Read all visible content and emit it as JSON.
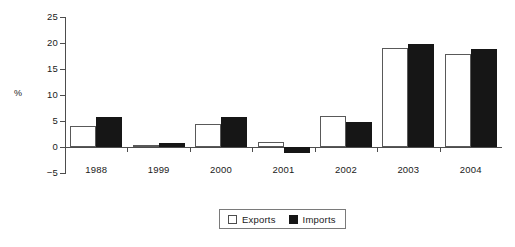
{
  "chart_data": {
    "type": "bar",
    "title": "",
    "subtitle": "",
    "xlabel": "",
    "ylabel": "%",
    "categories": [
      "1988",
      "1999",
      "2000",
      "2001",
      "2002",
      "2003",
      "2004"
    ],
    "series": [
      {
        "name": "Exports",
        "values": [
          4.0,
          0.4,
          4.4,
          1.0,
          6.0,
          19.0,
          17.8
        ],
        "color": "#ffffff",
        "edge_color": "#595959"
      },
      {
        "name": "Imports",
        "values": [
          5.8,
          0.7,
          5.8,
          -1.1,
          4.8,
          19.9,
          18.8
        ],
        "color": "#161616",
        "edge_color": "#161616"
      }
    ],
    "ylim": [
      -5,
      25
    ],
    "yticks": [
      25,
      20,
      15,
      10,
      5,
      0,
      -5
    ],
    "ytick_labels": [
      "25",
      "20",
      "15",
      "10",
      "5",
      "0",
      "−5"
    ],
    "grid": false,
    "legend_position": "bottom-center",
    "axis_color": "#4d4d4d",
    "background": "#ffffff"
  },
  "legend": {
    "entries": [
      {
        "label": "Exports",
        "swatch": "white-square-icon"
      },
      {
        "label": "Imports",
        "swatch": "black-square-icon"
      }
    ]
  }
}
